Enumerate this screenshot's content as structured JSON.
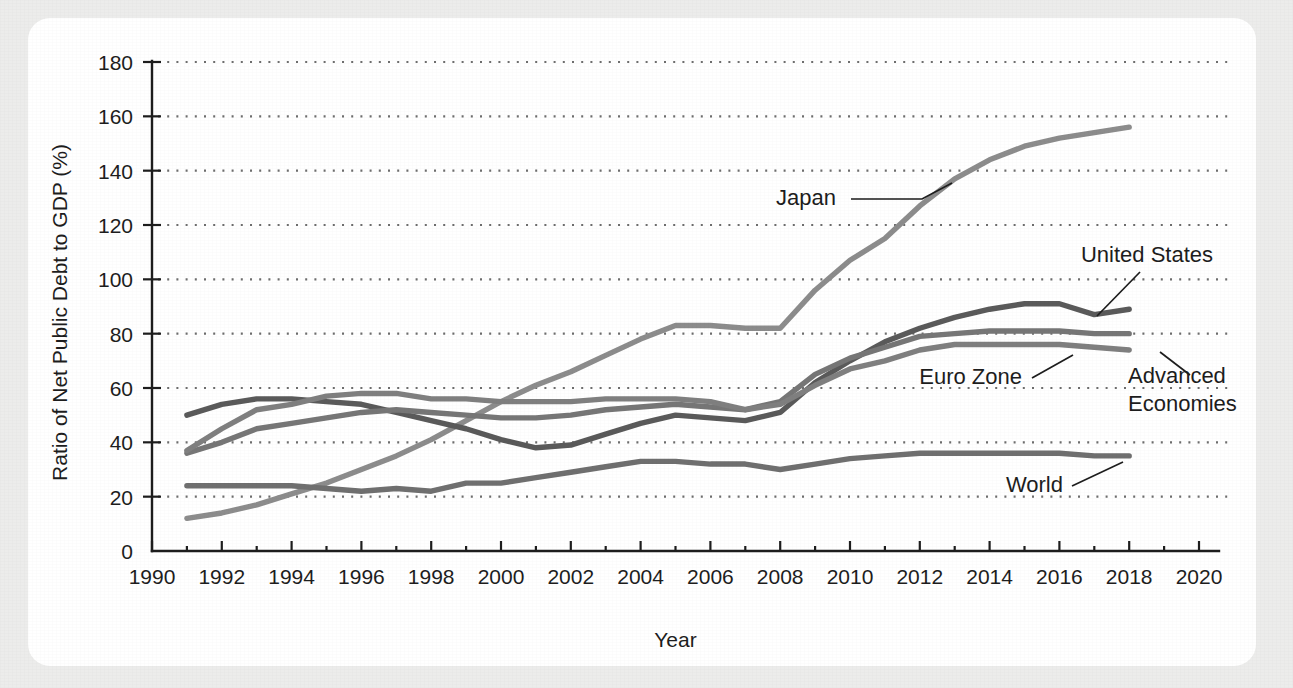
{
  "figure": {
    "background_color": "#ececeb",
    "card_color": "#ffffff"
  },
  "chart_data": {
    "type": "line",
    "title": "",
    "xlabel": "Year",
    "ylabel": "Ratio of Net Public Debt to GDP (%)",
    "xlim": [
      1990,
      2020
    ],
    "ylim": [
      0,
      180
    ],
    "grid": "horizontal-dotted",
    "legend_position": "inline-annotations",
    "x_ticks": [
      1990,
      1992,
      1994,
      1996,
      1998,
      2000,
      2002,
      2004,
      2006,
      2008,
      2010,
      2012,
      2014,
      2016,
      2018,
      2020
    ],
    "x_tick_labels": [
      "1990",
      "1992",
      "1994",
      "1996",
      "1998",
      "2000",
      "2002",
      "2004",
      "2006",
      "2008",
      "2010",
      "2012",
      "2014",
      "2016",
      "2018",
      "2020"
    ],
    "x_minor_ticks": [
      1991,
      1993,
      1995,
      1997,
      1999,
      2001,
      2003,
      2005,
      2007,
      2009,
      2011,
      2013,
      2015,
      2017,
      2019
    ],
    "y_ticks": [
      0,
      20,
      40,
      60,
      80,
      100,
      120,
      140,
      160,
      180
    ],
    "y_tick_labels": [
      "0",
      "20",
      "40",
      "60",
      "80",
      "100",
      "120",
      "140",
      "160",
      "180"
    ],
    "x": [
      1991,
      1992,
      1993,
      1994,
      1995,
      1996,
      1997,
      1998,
      1999,
      2000,
      2001,
      2002,
      2003,
      2004,
      2005,
      2006,
      2007,
      2008,
      2009,
      2010,
      2011,
      2012,
      2013,
      2014,
      2015,
      2016,
      2017,
      2018
    ],
    "series": [
      {
        "name": "Japan",
        "color": "#8c8c8c",
        "values": [
          12,
          14,
          17,
          21,
          25,
          30,
          35,
          41,
          48,
          55,
          61,
          66,
          72,
          78,
          83,
          83,
          82,
          82,
          96,
          107,
          115,
          127,
          137,
          144,
          149,
          152,
          154,
          156
        ]
      },
      {
        "name": "United States",
        "color": "#5a5a5a",
        "values": [
          50,
          54,
          56,
          56,
          55,
          54,
          51,
          48,
          45,
          41,
          38,
          39,
          43,
          47,
          50,
          49,
          48,
          51,
          62,
          70,
          77,
          82,
          86,
          89,
          91,
          91,
          87,
          89
        ]
      },
      {
        "name": "Advanced Economies",
        "color": "#767676",
        "values": [
          36,
          40,
          45,
          47,
          49,
          51,
          52,
          51,
          50,
          49,
          49,
          50,
          52,
          53,
          54,
          53,
          52,
          55,
          65,
          71,
          75,
          79,
          80,
          81,
          81,
          81,
          80,
          80
        ]
      },
      {
        "name": "Euro Zone",
        "color": "#7f7f7f",
        "values": [
          37,
          45,
          52,
          54,
          57,
          58,
          58,
          56,
          56,
          55,
          55,
          55,
          56,
          56,
          56,
          55,
          52,
          54,
          61,
          67,
          70,
          74,
          76,
          76,
          76,
          76,
          75,
          74
        ]
      },
      {
        "name": "World",
        "color": "#6f6f6f",
        "values": [
          24,
          24,
          24,
          24,
          23,
          22,
          23,
          22,
          25,
          25,
          27,
          29,
          31,
          33,
          33,
          32,
          32,
          30,
          32,
          34,
          35,
          36,
          36,
          36,
          36,
          36,
          35,
          35
        ]
      }
    ],
    "annotations": [
      {
        "label": "Japan",
        "anchor_year": 2010.1,
        "anchor_value": 122.5
      },
      {
        "label": "United States",
        "anchor_year": 2017.0,
        "anchor_value": 89.0
      },
      {
        "label": "Euro Zone",
        "anchor_year": 2015.6,
        "anchor_value": 76.0
      },
      {
        "label": "Advanced Economies",
        "line1": "Advanced",
        "line2": "Economies",
        "anchor_year": 2018.0,
        "anchor_value": 80.0
      },
      {
        "label": "World",
        "anchor_year": 2017.2,
        "anchor_value": 35.2
      }
    ]
  }
}
